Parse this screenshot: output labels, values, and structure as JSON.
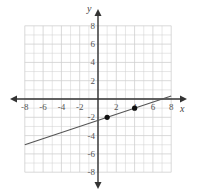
{
  "chart_data": {
    "type": "line",
    "title": "",
    "xlabel": "x",
    "ylabel": "y",
    "xlim": [
      -8,
      8
    ],
    "ylim": [
      -8,
      8
    ],
    "grid": true,
    "x_ticks": [
      -8,
      -6,
      -4,
      -2,
      2,
      4,
      6,
      8
    ],
    "y_ticks": [
      8,
      6,
      4,
      2,
      -2,
      -4,
      -6,
      -8
    ],
    "series": [
      {
        "name": "line",
        "equation": "y = (1/3)x - 7/3",
        "x": [
          -8,
          8
        ],
        "y": [
          -5,
          0.33
        ]
      }
    ],
    "points": [
      {
        "x": 1,
        "y": -2
      },
      {
        "x": 4,
        "y": -1
      }
    ],
    "colors": {
      "grid": "#cfcfcf",
      "axis": "#333333",
      "line": "#555555",
      "point": "#111111"
    }
  }
}
